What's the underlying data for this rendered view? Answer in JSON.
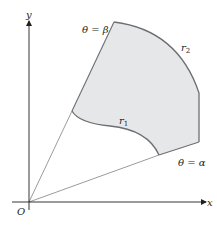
{
  "figure": {
    "type": "polar-region-diagram",
    "axes": {
      "x_label": "x",
      "y_label": "y",
      "origin_label": "O"
    },
    "rays": [
      {
        "name": "theta-beta",
        "label": "θ = β"
      },
      {
        "name": "theta-alpha",
        "label": "θ = α"
      }
    ],
    "curves": [
      {
        "name": "r1",
        "label_base": "r",
        "label_sub": "1"
      },
      {
        "name": "r2",
        "label_base": "r",
        "label_sub": "2"
      }
    ],
    "colors": {
      "region_fill": "#e6e7e8",
      "boundary_stroke": "#6d6e71",
      "axis_stroke": "#231f20",
      "ray_stroke": "#808285",
      "text": "#231f20"
    }
  }
}
